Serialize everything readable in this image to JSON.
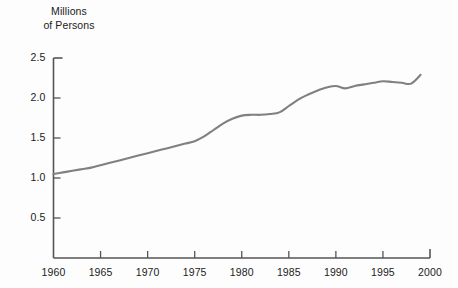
{
  "chart_data": {
    "type": "line",
    "title": "",
    "ylabel": "Millions\nof Persons",
    "ylabel_line1": "Millions",
    "ylabel_line2": "of Persons",
    "xlabel": "",
    "xlim": [
      1960,
      2000
    ],
    "ylim": [
      0,
      2.5
    ],
    "grid": false,
    "legend": false,
    "line_color": "#808080",
    "axis_color": "#555555",
    "text_color": "#1b1b1b",
    "background": "#fdfdfd",
    "ytick_labels": [
      "2.5",
      "2.0",
      "1.5",
      "1.0",
      "0.5"
    ],
    "ytick_values": [
      2.5,
      2.0,
      1.5,
      1.0,
      0.5
    ],
    "xtick_labels": [
      "1960",
      "1965",
      "1970",
      "1975",
      "1980",
      "1985",
      "1990",
      "1995",
      "2000"
    ],
    "xtick_values": [
      1960,
      1965,
      1970,
      1975,
      1980,
      1985,
      1990,
      1995,
      2000
    ],
    "x": [
      1960,
      1961,
      1962,
      1963,
      1964,
      1965,
      1966,
      1967,
      1968,
      1969,
      1970,
      1971,
      1972,
      1973,
      1974,
      1975,
      1976,
      1977,
      1978,
      1979,
      1980,
      1981,
      1982,
      1983,
      1984,
      1985,
      1986,
      1987,
      1988,
      1989,
      1990,
      1991,
      1992,
      1993,
      1994,
      1995,
      1996,
      1997,
      1998,
      1999
    ],
    "values": [
      1.05,
      1.07,
      1.09,
      1.11,
      1.13,
      1.16,
      1.19,
      1.22,
      1.25,
      1.28,
      1.31,
      1.34,
      1.37,
      1.4,
      1.43,
      1.46,
      1.52,
      1.6,
      1.68,
      1.74,
      1.78,
      1.79,
      1.79,
      1.8,
      1.82,
      1.9,
      1.98,
      2.04,
      2.09,
      2.13,
      2.15,
      2.12,
      2.15,
      2.17,
      2.19,
      2.21,
      2.2,
      2.19,
      2.18,
      2.29
    ],
    "series": [
      {
        "name": "Millions of Persons",
        "values": [
          1.05,
          1.07,
          1.09,
          1.11,
          1.13,
          1.16,
          1.19,
          1.22,
          1.25,
          1.28,
          1.31,
          1.34,
          1.37,
          1.4,
          1.43,
          1.46,
          1.52,
          1.6,
          1.68,
          1.74,
          1.78,
          1.79,
          1.79,
          1.8,
          1.82,
          1.9,
          1.98,
          2.04,
          2.09,
          2.13,
          2.15,
          2.12,
          2.15,
          2.17,
          2.19,
          2.21,
          2.2,
          2.19,
          2.18,
          2.29
        ]
      }
    ]
  }
}
